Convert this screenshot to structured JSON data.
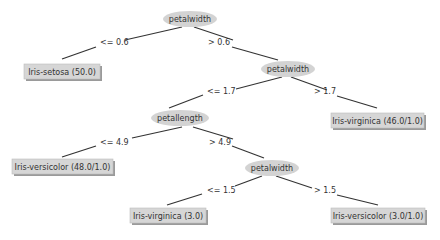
{
  "diagram": {
    "type": "decision-tree",
    "nodes": {
      "root": {
        "kind": "split",
        "label": "petalwidth"
      },
      "leaf_setosa": {
        "kind": "leaf",
        "label": "Iris-setosa (50.0)"
      },
      "split_pw2": {
        "kind": "split",
        "label": "petalwidth"
      },
      "leaf_virginica_46": {
        "kind": "leaf",
        "label": "Iris-virginica (46.0/1.0)"
      },
      "split_pl": {
        "kind": "split",
        "label": "petallength"
      },
      "leaf_versicolor_48": {
        "kind": "leaf",
        "label": "Iris-versicolor (48.0/1.0)"
      },
      "split_pw3": {
        "kind": "split",
        "label": "petalwidth"
      },
      "leaf_virginica_3": {
        "kind": "leaf",
        "label": "Iris-virginica (3.0)"
      },
      "leaf_versicolor_3": {
        "kind": "leaf",
        "label": "Iris-versicolor (3.0/1.0)"
      }
    },
    "edges": {
      "root_left": {
        "from": "root",
        "to": "leaf_setosa",
        "label": "<= 0.6"
      },
      "root_right": {
        "from": "root",
        "to": "split_pw2",
        "label": "> 0.6"
      },
      "pw2_left": {
        "from": "split_pw2",
        "to": "split_pl",
        "label": "<= 1.7"
      },
      "pw2_right": {
        "from": "split_pw2",
        "to": "leaf_virginica_46",
        "label": "> 1.7"
      },
      "pl_left": {
        "from": "split_pl",
        "to": "leaf_versicolor_48",
        "label": "<= 4.9"
      },
      "pl_right": {
        "from": "split_pl",
        "to": "split_pw3",
        "label": "> 4.9"
      },
      "pw3_left": {
        "from": "split_pw3",
        "to": "leaf_virginica_3",
        "label": "<= 1.5"
      },
      "pw3_right": {
        "from": "split_pw3",
        "to": "leaf_versicolor_3",
        "label": "> 1.5"
      }
    },
    "colors": {
      "split_fill": "#d3d3d3",
      "leaf_fill": "#d6d6d6",
      "leaf_shadow": "#9a9a9a",
      "edge": "#333333",
      "text": "#333333"
    }
  }
}
